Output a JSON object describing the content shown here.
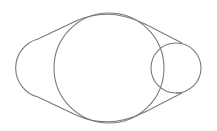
{
  "diagram": {
    "stroke_color": "#7a7a7a",
    "background": "#ffffff",
    "shapes": {
      "large_circle": {
        "cx": 109,
        "cy": 68,
        "r": 55
      },
      "small_circle": {
        "cx": 176,
        "cy": 68,
        "r": 25
      },
      "left_arc": {
        "cx": 48,
        "cy": 68,
        "r": 30
      }
    }
  }
}
